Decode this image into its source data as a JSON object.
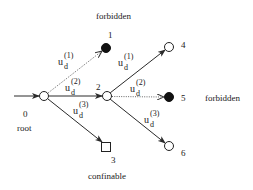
{
  "diagram": {
    "type": "tree",
    "nodes": [
      {
        "id": "0",
        "label": "0",
        "caption": "root",
        "shape": "circle-open",
        "x": 44,
        "y": 96
      },
      {
        "id": "1",
        "label": "1",
        "caption": "forbidden",
        "shape": "circle-filled",
        "x": 106,
        "y": 48
      },
      {
        "id": "2",
        "label": "2",
        "caption": "",
        "shape": "circle-open",
        "x": 107,
        "y": 96
      },
      {
        "id": "3",
        "label": "3",
        "caption": "confinable",
        "shape": "square-open",
        "x": 106,
        "y": 147
      },
      {
        "id": "4",
        "label": "4",
        "caption": "",
        "shape": "circle-open",
        "x": 169,
        "y": 47
      },
      {
        "id": "5",
        "label": "5",
        "caption": "forbidden",
        "shape": "circle-filled",
        "x": 169,
        "y": 97
      },
      {
        "id": "6",
        "label": "6",
        "caption": "",
        "shape": "circle-open",
        "x": 169,
        "y": 146
      }
    ],
    "edges": [
      {
        "from": "input",
        "to": "0",
        "label": "",
        "style": "solid"
      },
      {
        "from": "0",
        "to": "1",
        "label": "u_d^(1)",
        "style": "dotted"
      },
      {
        "from": "0",
        "to": "2",
        "label": "u_d^(2)",
        "style": "solid"
      },
      {
        "from": "0",
        "to": "3",
        "label": "u_d^(3)",
        "style": "solid"
      },
      {
        "from": "2",
        "to": "4",
        "label": "u_d^(1)",
        "style": "solid"
      },
      {
        "from": "2",
        "to": "5",
        "label": "u_d^(2)",
        "style": "dotted"
      },
      {
        "from": "2",
        "to": "6",
        "label": "u_d^(3)",
        "style": "solid"
      }
    ],
    "edge_label": {
      "base": "u",
      "sub": "d",
      "sup1": "(1)",
      "sup2": "(2)",
      "sup3": "(3)"
    },
    "captions": {
      "root": "root",
      "forbidden_top": "forbidden",
      "forbidden_right": "forbidden",
      "confinable": "confinable"
    },
    "node_labels": {
      "n0": "0",
      "n1": "1",
      "n2": "2",
      "n3": "3",
      "n4": "4",
      "n5": "5",
      "n6": "6"
    }
  }
}
